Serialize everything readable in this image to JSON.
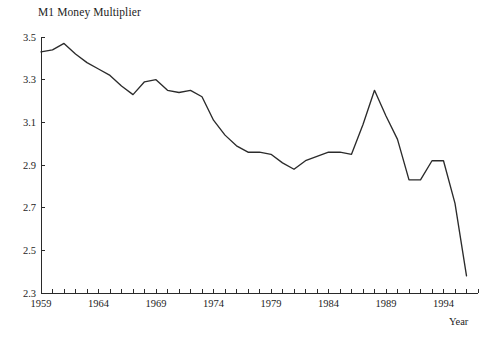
{
  "chart_data": {
    "type": "line",
    "title": "M1 Money Multiplier",
    "xlabel": "Year",
    "ylabel": "",
    "xlim": [
      1959,
      1997
    ],
    "ylim": [
      2.3,
      3.5
    ],
    "grid": false,
    "legend": false,
    "yticks": [
      "3.5",
      "3.3",
      "3.1",
      "2.9",
      "2.7",
      "2.5",
      "2.3"
    ],
    "ytick_values": [
      3.5,
      3.3,
      3.1,
      2.9,
      2.7,
      2.5,
      2.3
    ],
    "xticks": [
      "1959",
      "1964",
      "1969",
      "1974",
      "1979",
      "1984",
      "1989",
      "1994"
    ],
    "xtick_values": [
      1959,
      1964,
      1969,
      1974,
      1979,
      1984,
      1989,
      1994
    ],
    "xtick_minor_step": 1,
    "series": [
      {
        "name": "M1 Money Multiplier",
        "color": "#2b2b2b",
        "x": [
          1959,
          1960,
          1961,
          1962,
          1963,
          1964,
          1965,
          1966,
          1967,
          1968,
          1969,
          1970,
          1971,
          1972,
          1973,
          1974,
          1975,
          1976,
          1977,
          1978,
          1979,
          1980,
          1981,
          1982,
          1983,
          1984,
          1985,
          1986,
          1987,
          1988,
          1989,
          1990,
          1991,
          1992,
          1993,
          1994,
          1995,
          1996
        ],
        "y": [
          3.43,
          3.44,
          3.47,
          3.42,
          3.38,
          3.35,
          3.32,
          3.27,
          3.23,
          3.29,
          3.3,
          3.25,
          3.24,
          3.25,
          3.22,
          3.11,
          3.04,
          2.99,
          2.96,
          2.96,
          2.95,
          2.91,
          2.88,
          2.92,
          2.94,
          2.96,
          2.96,
          2.95,
          3.09,
          3.25,
          3.13,
          3.02,
          2.83,
          2.83,
          2.92,
          2.92,
          2.72,
          2.38
        ]
      }
    ]
  }
}
